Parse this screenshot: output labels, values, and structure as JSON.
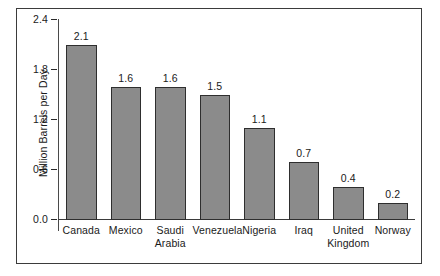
{
  "chart_data": {
    "type": "bar",
    "title": "",
    "subtitle": "",
    "xlabel": "",
    "ylabel": "Million Barrels per Day",
    "ylim": [
      0.0,
      2.4
    ],
    "grid": false,
    "legend": "none",
    "y_ticks": [
      "2.4",
      "1.8",
      "1.2",
      "0.6",
      "0.0"
    ],
    "y_tick_values": [
      2.4,
      1.8,
      1.2,
      0.6,
      0.0
    ],
    "categories": [
      "Canada",
      "Mexico",
      "Saudi Arabia",
      "Venezuela",
      "Nigeria",
      "Iraq",
      "United Kingdom",
      "Norway"
    ],
    "category_lines": [
      [
        "Canada"
      ],
      [
        "Mexico"
      ],
      [
        "Saudi",
        "Arabia"
      ],
      [
        "Venezuela"
      ],
      [
        "Nigeria"
      ],
      [
        "Iraq"
      ],
      [
        "United",
        "Kingdom"
      ],
      [
        "Norway"
      ]
    ],
    "values": [
      2.1,
      1.6,
      1.6,
      1.5,
      1.1,
      0.7,
      0.4,
      0.2
    ],
    "value_labels": [
      "2.1",
      "1.6",
      "1.6",
      "1.5",
      "1.1",
      "0.7",
      "0.4",
      "0.2"
    ],
    "bar_fill_color": "#8b8b8b",
    "bar_border_color": "#2e2e2e",
    "axis_color": "#3b3b3b",
    "text_color": "#1a1a1a",
    "background_color": "#ffffff"
  }
}
